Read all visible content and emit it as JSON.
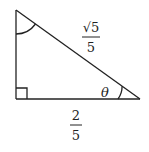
{
  "diagram": {
    "type": "right-triangle",
    "colors": {
      "stroke": "#222222",
      "background": "#ffffff"
    },
    "vertices": {
      "top": [
        16,
        10
      ],
      "right_angle": [
        16,
        99
      ],
      "right": [
        140,
        99
      ]
    },
    "labels": {
      "hypotenuse": {
        "numerator": "√5",
        "denominator": "5"
      },
      "base": {
        "numerator": "2",
        "denominator": "5"
      },
      "angle": "θ"
    },
    "markers": {
      "right_angle": "square at bottom-left vertex",
      "angle_arcs": [
        "top vertex",
        "right vertex (θ)"
      ]
    }
  }
}
